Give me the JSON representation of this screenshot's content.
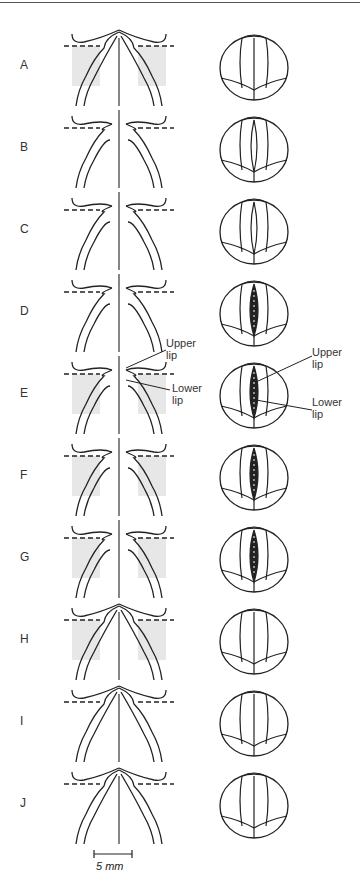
{
  "figure": {
    "rows": [
      {
        "label": "A",
        "state": "closed",
        "section": "closed",
        "glottis": "closed"
      },
      {
        "label": "B",
        "state": "opening",
        "section": "open",
        "glottis": "slightly-open"
      },
      {
        "label": "C",
        "state": "opening",
        "section": "open",
        "glottis": "slightly-open"
      },
      {
        "label": "D",
        "state": "open",
        "section": "open",
        "glottis": "open"
      },
      {
        "label": "E",
        "state": "open",
        "section": "open-labeled",
        "glottis": "open-labeled"
      },
      {
        "label": "F",
        "state": "closing",
        "section": "closing",
        "glottis": "wide"
      },
      {
        "label": "G",
        "state": "closing",
        "section": "closing",
        "glottis": "narrowing"
      },
      {
        "label": "H",
        "state": "closed",
        "section": "closed",
        "glottis": "closed"
      },
      {
        "label": "I",
        "state": "closed",
        "section": "closed",
        "glottis": "closed"
      },
      {
        "label": "J",
        "state": "closed",
        "section": "closed",
        "glottis": "closed"
      }
    ],
    "callouts": {
      "section_upper_lip": "Upper\nlip",
      "section_lower_lip": "Lower\nlip",
      "glottis_upper_lip": "Upper\nlip",
      "glottis_lower_lip": "Lower\nlip"
    },
    "scale_bar": {
      "label": "5 mm"
    }
  }
}
